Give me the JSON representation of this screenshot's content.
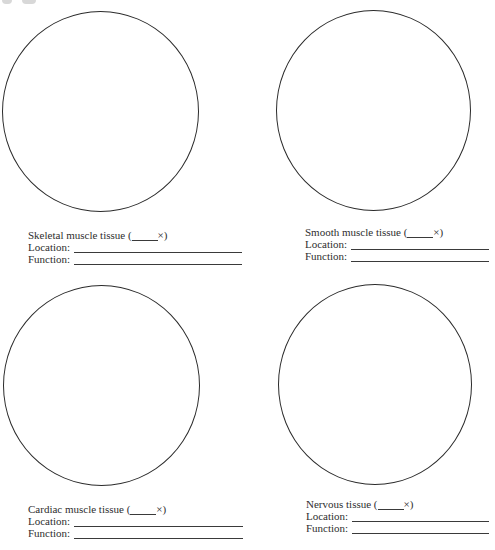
{
  "panels": [
    {
      "title_prefix": "Skeletal muscle tissue (",
      "mag_suffix": "×)",
      "location_label": "Location:",
      "function_label": "Function:"
    },
    {
      "title_prefix": "Smooth muscle tissue (",
      "mag_suffix": "×)",
      "location_label": "Location:",
      "function_label": "Function:"
    },
    {
      "title_prefix": "Cardiac muscle tissue (",
      "mag_suffix": "×)",
      "location_label": "Location:",
      "function_label": "Function:"
    },
    {
      "title_prefix": "Nervous tissue (",
      "mag_suffix": "×)",
      "location_label": "Location:",
      "function_label": "Function:"
    }
  ]
}
